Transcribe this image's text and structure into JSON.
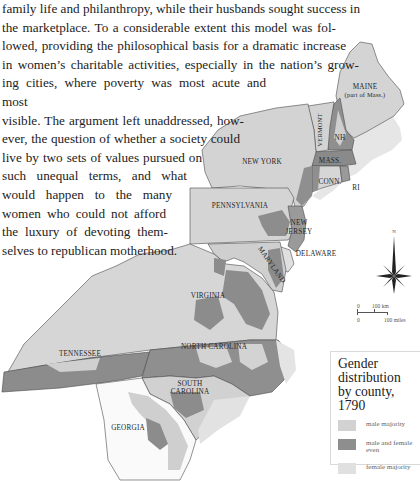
{
  "body_text": {
    "lines": [
      "family life and philanthropy, while their husbands sought success in",
      "the marketplace. To a considerable extent this model was fol-",
      "lowed, providing the philosophical basis for a dramatic increase",
      "in women’s charitable activities, especially in the nation’s grow-",
      "ing cities, where poverty was most acute and most",
      "visible. The argument left unaddressed, how-",
      "ever, the question of whether a society could",
      "live by two sets of values pursued on",
      "such unequal terms, and what",
      "would happen to the many",
      "women who could not afford",
      "the luxury of devoting them-",
      "selves to republican motherhood."
    ]
  },
  "map": {
    "colors": {
      "male_majority": "#d2d2d2",
      "even": "#8e8e8e",
      "female_majority": "#e4e4e4",
      "border": "#4a4a4a",
      "georgia": "#fafafa"
    },
    "state_labels": {
      "maine": "MAINE",
      "maine_sub": "(part of Mass.)",
      "vermont": "VERMONT",
      "nh": "NH",
      "new_york": "NEW YORK",
      "mass": "MASS.",
      "conn": "CONN.",
      "ri": "RI",
      "pennsylvania": "PENNSYLVANIA",
      "new_jersey_1": "NEW",
      "new_jersey_2": "JERSEY",
      "delaware": "DELAWARE",
      "maryland": "MARYLAND",
      "virginia": "VIRGINIA",
      "tennessee": "TENNESSEE",
      "north_carolina": "NORTH CAROLINA",
      "south_carolina_1": "SOUTH",
      "south_carolina_2": "CAROLINA",
      "georgia": "GEORGIA"
    },
    "compass": {
      "north_label": "N"
    },
    "scale": {
      "km_zero": "0",
      "km_label": "100 km",
      "mi_zero": "0",
      "mi_label": "100 miles"
    }
  },
  "legend": {
    "title_1": "Gender",
    "title_2": "distribution",
    "title_3": "by county, 1790",
    "items": [
      {
        "label": "male majority",
        "color": "#d2d2d2"
      },
      {
        "label": "male and female even",
        "label_1": "male and female",
        "label_2": "even",
        "color": "#8e8e8e"
      },
      {
        "label": "female majority",
        "color": "#e0e0e0"
      }
    ]
  }
}
